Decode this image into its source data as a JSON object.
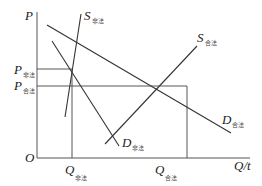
{
  "diagram": {
    "type": "supply-demand",
    "axes": {
      "y_label": "P",
      "x_label": "Q/t",
      "origin_label": "O"
    },
    "curves": [
      {
        "id": "S_illegal",
        "label": "S",
        "subscript": "非法",
        "kind": "supply"
      },
      {
        "id": "S_legal",
        "label": "S",
        "subscript": "合法",
        "kind": "supply"
      },
      {
        "id": "D_illegal",
        "label": "D",
        "subscript": "非法",
        "kind": "demand"
      },
      {
        "id": "D_legal",
        "label": "D",
        "subscript": "合法",
        "kind": "demand"
      }
    ],
    "price_levels": [
      {
        "id": "P_illegal",
        "label": "P",
        "subscript": "非法"
      },
      {
        "id": "P_legal",
        "label": "P",
        "subscript": "合法"
      }
    ],
    "quantity_levels": [
      {
        "id": "Q_illegal",
        "label": "Q",
        "subscript": "非法"
      },
      {
        "id": "Q_legal",
        "label": "Q",
        "subscript": "合法"
      }
    ],
    "colors": {
      "line": "#333333",
      "background": "#ffffff"
    }
  }
}
